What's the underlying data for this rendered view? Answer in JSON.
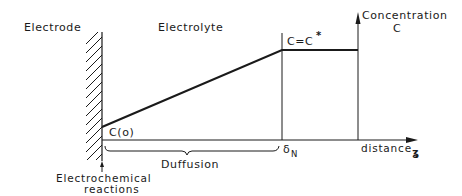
{
  "diagram": {
    "labels": {
      "electrode": "Electrode",
      "electrolyte": "Electrolyte",
      "concentration_line1": "Concentration",
      "concentration_line2": "C",
      "bulk_concentration": "C=C",
      "bulk_superscript": "*",
      "surface_concentration": "C(o)",
      "diffusion": "Duffusion",
      "delta": "δ",
      "delta_subscript": "N",
      "distance": "distance",
      "distance_symbol": "ʓ",
      "reactions_line1": "Electrochemical",
      "reactions_line2": "reactions"
    },
    "colors": {
      "line": "#1a1a1a",
      "background": "#ffffff"
    },
    "profile": {
      "surface_value_label": "C(o)",
      "bulk_value_label": "C=C*",
      "boundary_label": "δN",
      "segments": [
        {
          "type": "linear-rise",
          "from": "electrode (z=0)",
          "to": "δN"
        },
        {
          "type": "constant",
          "from": "δN",
          "to": "bulk"
        }
      ]
    }
  }
}
